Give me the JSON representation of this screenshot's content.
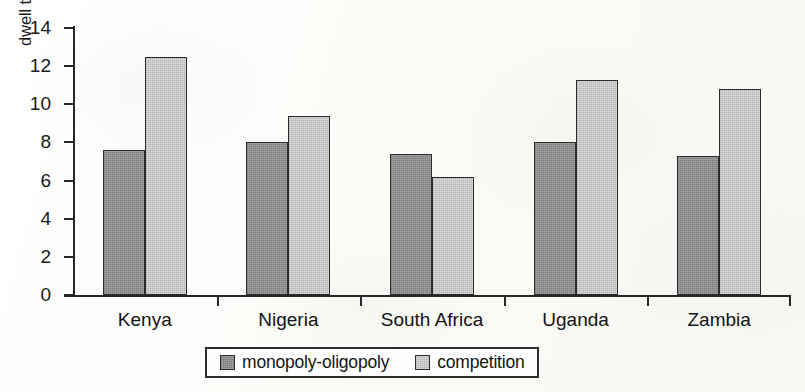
{
  "chart_data": {
    "type": "bar",
    "title": "",
    "xlabel": "",
    "ylabel": "dwell time (number of days)",
    "ylim": [
      0,
      14
    ],
    "yticks": [
      0,
      2,
      4,
      6,
      8,
      10,
      12,
      14
    ],
    "ytick_labels": [
      "0",
      "2",
      "4",
      "6",
      "8",
      "10",
      "12",
      "14"
    ],
    "grid": false,
    "legend_position": "bottom-center",
    "categories": [
      "Kenya",
      "Nigeria",
      "South Africa",
      "Uganda",
      "Zambia"
    ],
    "series": [
      {
        "name": "monopoly-oligopoly",
        "color": "#8d8d8d",
        "values": [
          7.6,
          8.0,
          7.4,
          8.0,
          7.3
        ]
      },
      {
        "name": "competition",
        "color": "#cacaca",
        "values": [
          12.5,
          9.4,
          6.2,
          11.3,
          10.8
        ]
      }
    ]
  },
  "legend": {
    "items": [
      {
        "label": "monopoly-oligopoly",
        "swatch": "dark"
      },
      {
        "label": "competition",
        "swatch": "light"
      }
    ]
  }
}
